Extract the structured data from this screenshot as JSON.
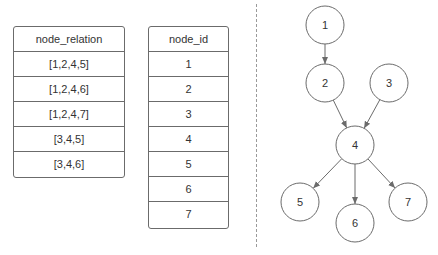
{
  "tables": {
    "relation": {
      "header": "node_relation",
      "rows": [
        "[1,2,4,5]",
        "[1,2,4,6]",
        "[1,2,4,7]",
        "[3,4,5]",
        "[3,4,6]"
      ]
    },
    "node": {
      "header": "node_id",
      "rows": [
        "1",
        "2",
        "3",
        "4",
        "5",
        "6",
        "7"
      ]
    }
  },
  "graph": {
    "nodes": [
      {
        "id": "1",
        "label": "1",
        "cx": 325,
        "cy": 25
      },
      {
        "id": "2",
        "label": "2",
        "cx": 325,
        "cy": 83
      },
      {
        "id": "3",
        "label": "3",
        "cx": 389,
        "cy": 83
      },
      {
        "id": "4",
        "label": "4",
        "cx": 355,
        "cy": 145
      },
      {
        "id": "5",
        "label": "5",
        "cx": 300,
        "cy": 202
      },
      {
        "id": "6",
        "label": "6",
        "cx": 355,
        "cy": 223
      },
      {
        "id": "7",
        "label": "7",
        "cx": 408,
        "cy": 202
      }
    ],
    "edges": [
      {
        "from": "1",
        "to": "2"
      },
      {
        "from": "2",
        "to": "4"
      },
      {
        "from": "3",
        "to": "4"
      },
      {
        "from": "4",
        "to": "5"
      },
      {
        "from": "4",
        "to": "6"
      },
      {
        "from": "4",
        "to": "7"
      }
    ],
    "node_radius": 19,
    "stroke_color": "#6b6b6b"
  }
}
